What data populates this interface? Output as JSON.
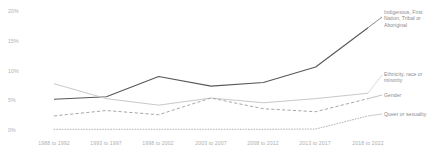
{
  "chart_data": {
    "type": "line",
    "title": "",
    "xlabel": "",
    "ylabel": "",
    "ylim": [
      0,
      20
    ],
    "yticks": [
      "0%",
      "5%",
      "10%",
      "15%",
      "20%"
    ],
    "ytick_values": [
      0,
      5,
      10,
      15,
      20
    ],
    "grid": false,
    "legend": "right-inline-labels",
    "categories": [
      "1988 to 1992",
      "1993 to 1997",
      "1998 to 2002",
      "2003 to 2007",
      "2008 to 2012",
      "2013 to 2017",
      "2018 to 2022"
    ],
    "series": [
      {
        "name": "Indigenous, First Nation, Tribal or Aboriginal",
        "label": "Indigenous, First\nNation, Tribal or\nAboriginal",
        "style": "solid",
        "color": "#58585a",
        "width": 1.1,
        "values": [
          5.2,
          5.6,
          9.0,
          7.4,
          8.0,
          10.6,
          17.2
        ]
      },
      {
        "name": "Ethnicity, race or minority",
        "label": "Ethnicity, race or\nminority",
        "style": "solid",
        "color": "#c9c9c9",
        "width": 1.0,
        "values": [
          7.8,
          5.3,
          4.2,
          5.4,
          4.6,
          5.3,
          6.2
        ]
      },
      {
        "name": "Gender",
        "label": "Gender",
        "style": "dashed",
        "color": "#a8a8a8",
        "width": 1.0,
        "values": [
          2.4,
          3.3,
          2.6,
          5.4,
          3.6,
          3.1,
          5.3
        ]
      },
      {
        "name": "Queer or sexuality",
        "label": "Queer or sexuality",
        "style": "dotted",
        "color": "#b5b5b5",
        "width": 1.0,
        "values": [
          0.15,
          0.15,
          0.15,
          0.15,
          0.15,
          0.2,
          2.4
        ]
      }
    ]
  }
}
